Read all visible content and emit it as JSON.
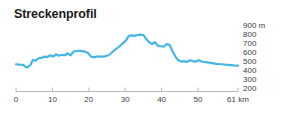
{
  "title": "Streckenprofil",
  "accent_color": "#45b6e6",
  "axis_color": "#b8b8b8",
  "text_color": "#3d3d3d",
  "y_axis": {
    "unit_label": "900 m",
    "ticks": [
      "900 m",
      "800",
      "700",
      "600",
      "500",
      "400",
      "300",
      "200"
    ],
    "values": [
      900,
      800,
      700,
      600,
      500,
      400,
      300,
      200
    ]
  },
  "x_axis": {
    "ticks": [
      "0",
      "10",
      "20",
      "30",
      "40",
      "50",
      "61 km"
    ],
    "values": [
      0,
      10,
      20,
      30,
      40,
      50,
      61
    ]
  },
  "chart_data": {
    "type": "line",
    "title": "Streckenprofil",
    "xlabel": "km",
    "ylabel": "m",
    "xlim": [
      0,
      61
    ],
    "ylim": [
      200,
      900
    ],
    "grid": false,
    "legend": null,
    "series": [
      {
        "name": "Höhenprofil",
        "x": [
          0,
          1,
          2,
          2.6,
          3.2,
          4,
          4.6,
          5.4,
          6.2,
          7,
          7.8,
          8.6,
          9.4,
          10.2,
          11,
          11.8,
          12.6,
          13.4,
          14.2,
          15,
          15.8,
          16.6,
          17.4,
          18.2,
          19,
          19.8,
          20.6,
          21.4,
          22.2,
          23,
          23.8,
          24.6,
          25.4,
          26.2,
          27,
          27.8,
          28.6,
          29.4,
          30.2,
          31,
          31.8,
          32.6,
          33.4,
          34.2,
          35,
          35.8,
          36.6,
          37.4,
          38.2,
          39,
          39.8,
          40.6,
          41.4,
          42.2,
          43,
          43.8,
          44.6,
          45.4,
          46.2,
          47,
          47.8,
          48.6,
          49.4,
          50.2,
          51,
          51.8,
          52.6,
          53.4,
          54.2,
          55,
          55.8,
          56.6,
          57.4,
          58.2,
          59,
          59.8,
          61
        ],
        "y": [
          475,
          470,
          468,
          445,
          440,
          470,
          520,
          515,
          540,
          545,
          560,
          555,
          575,
          560,
          585,
          570,
          580,
          575,
          595,
          575,
          615,
          620,
          625,
          620,
          615,
          600,
          560,
          555,
          560,
          560,
          560,
          565,
          575,
          600,
          630,
          655,
          680,
          710,
          740,
          790,
          795,
          790,
          800,
          805,
          800,
          755,
          720,
          700,
          720,
          680,
          675,
          670,
          700,
          690,
          620,
          560,
          520,
          505,
          510,
          500,
          520,
          510,
          505,
          520,
          505,
          500,
          495,
          490,
          485,
          480,
          478,
          475,
          470,
          468,
          465,
          462,
          460
        ]
      }
    ]
  }
}
